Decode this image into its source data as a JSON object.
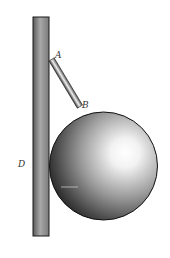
{
  "diagram": {
    "labels": {
      "A": "A",
      "B": "B",
      "D": "D"
    },
    "colors": {
      "outline": "#1a1a1a",
      "wall_dark": "#555555",
      "wall_light": "#bdbdbd",
      "ball_highlight": "#ffffff",
      "ball_shadow": "#2a2a2a",
      "label": "#333333"
    }
  }
}
